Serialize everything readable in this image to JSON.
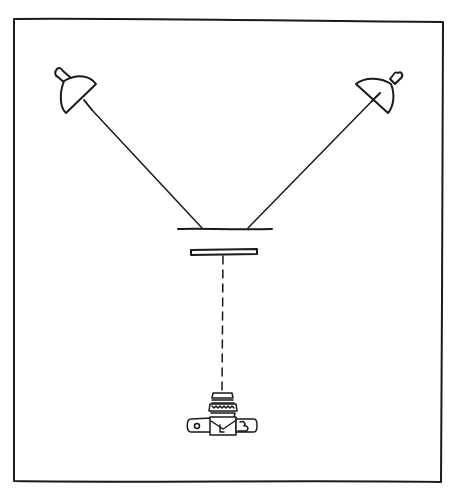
{
  "diagram": {
    "type": "copy-stand-lighting-setup",
    "colors": {
      "ink": "#1a1a1a",
      "background": "#ffffff"
    },
    "elements": [
      {
        "name": "frame-border",
        "shape": "rectangle"
      },
      {
        "name": "left-lamp",
        "shape": "reflector-lamp",
        "aimed_at": "copy-board"
      },
      {
        "name": "right-lamp",
        "shape": "reflector-lamp",
        "aimed_at": "copy-board"
      },
      {
        "name": "copy-board",
        "shape": "line"
      },
      {
        "name": "glass-plate",
        "shape": "rectangle"
      },
      {
        "name": "optical-axis",
        "shape": "dashed-line"
      },
      {
        "name": "camera",
        "shape": "camera-with-bellows-lens",
        "orientation": "pointing-up"
      }
    ]
  }
}
